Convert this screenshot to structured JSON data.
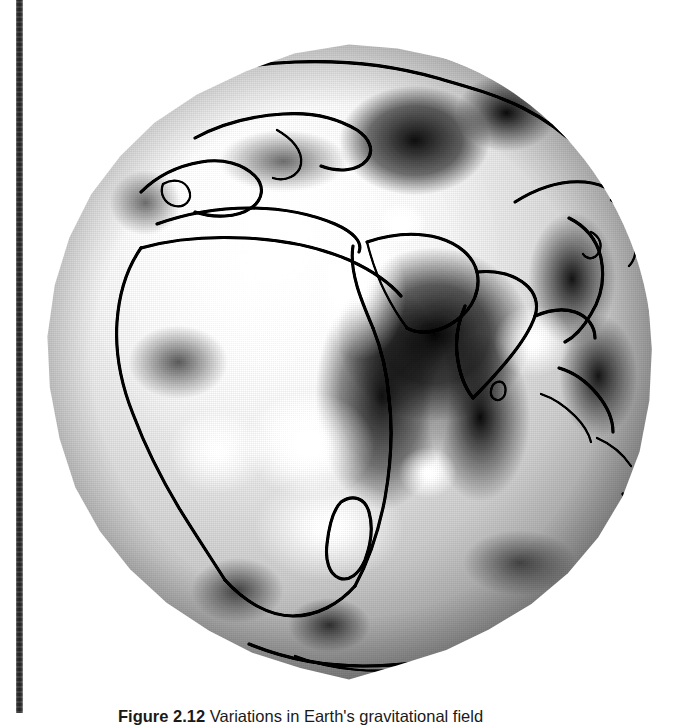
{
  "page": {
    "background_color": "#ffffff",
    "scan_gutter_color": "#222222"
  },
  "figure": {
    "kind": "globe-map",
    "projection": "orthographic",
    "view_center": "Indian Ocean / Africa–Asia hemisphere",
    "rendering": "grayscale shaded relief of geoid undulations",
    "colors": {
      "high_anomaly": "#ffffff",
      "low_anomaly": "#000000",
      "mid_tone": "#b5b5b5",
      "coastline": "#000000"
    },
    "features": [
      "Europe",
      "Mediterranean Sea",
      "North Africa",
      "Red Sea",
      "Arabian Peninsula",
      "India",
      "Madagascar",
      "East Asia",
      "Japan",
      "Indonesia",
      "Antarctica"
    ]
  },
  "caption": {
    "label": "Figure",
    "number": "2.12",
    "text": "Variations in Earth's gravitational field"
  }
}
